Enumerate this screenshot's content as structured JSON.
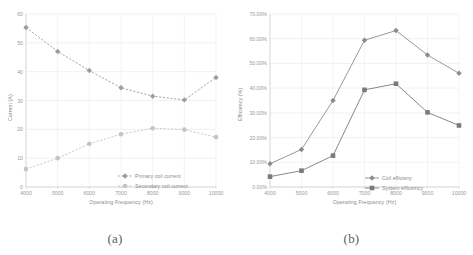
{
  "figure": {
    "panels": [
      {
        "caption": "(a)",
        "xlabel": "Operating Frequency (Hz)",
        "ylabel": "Current (A)"
      },
      {
        "caption": "(b)",
        "xlabel": "Operating Frequency (Hz)",
        "ylabel": "Efficiency (%)"
      }
    ]
  },
  "chart_data": [
    {
      "type": "line",
      "panel": "(a)",
      "title": "",
      "xlabel": "Operating Frequency (Hz)",
      "ylabel": "Current (A)",
      "categories": [
        4000,
        5000,
        6000,
        7000,
        8000,
        9000,
        10000
      ],
      "xticklabels": [
        "4000",
        "5000",
        "6000",
        "7000",
        "8000",
        "9000",
        "10000"
      ],
      "yticklabels": [
        "0",
        "10",
        "20",
        "30",
        "40",
        "50",
        "60"
      ],
      "yticks": [
        0,
        10,
        20,
        30,
        40,
        50,
        60
      ],
      "ylim": [
        0,
        60
      ],
      "grid": true,
      "legend_position": "lower-right-inside",
      "linestyle": "dashed",
      "series": [
        {
          "name": "Primary coil current",
          "color": "#9d9d9d",
          "marker": "diamond",
          "values": [
            55.3,
            47.0,
            40.4,
            34.4,
            31.5,
            30.2,
            38.0
          ]
        },
        {
          "name": "Secondary coil current",
          "color": "#c4c4c4",
          "marker": "circle",
          "values": [
            6.2,
            10.0,
            15.0,
            18.3,
            20.4,
            19.9,
            17.3
          ]
        }
      ]
    },
    {
      "type": "line",
      "panel": "(b)",
      "title": "",
      "xlabel": "Operating Frequency (Hz)",
      "ylabel": "Efficiency (%)",
      "categories": [
        4000,
        5000,
        6000,
        7000,
        8000,
        9000,
        10000
      ],
      "xticklabels": [
        "4000",
        "5000",
        "6000",
        "7000",
        "8000",
        "9000",
        "10000"
      ],
      "yticklabels": [
        "0.00%",
        "10.00%",
        "20.00%",
        "30.00%",
        "40.00%",
        "50.00%",
        "60.00%",
        "70.00%"
      ],
      "yticks": [
        0,
        10,
        20,
        30,
        40,
        50,
        60,
        70
      ],
      "ylim": [
        0,
        70
      ],
      "grid": true,
      "legend_position": "lower-right-inside",
      "linestyle": "solid",
      "series": [
        {
          "name": "Coil efficieny",
          "color": "#8c8c8c",
          "marker": "diamond",
          "values": [
            9.4,
            15.2,
            35.0,
            59.4,
            63.3,
            53.4,
            46.0
          ]
        },
        {
          "name": "System efficeincy",
          "color": "#7a7a7a",
          "marker": "square",
          "values": [
            4.2,
            6.6,
            12.7,
            39.3,
            41.8,
            30.2,
            24.9
          ]
        }
      ]
    }
  ]
}
